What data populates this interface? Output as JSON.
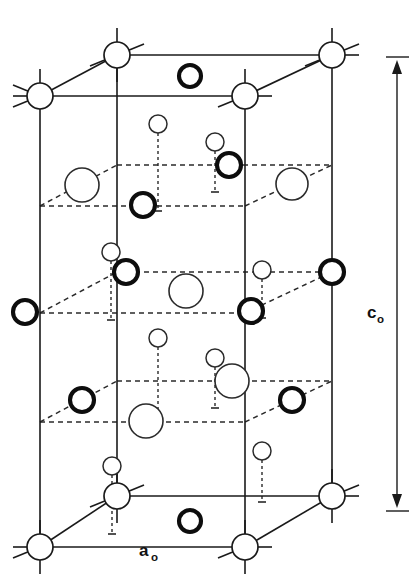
{
  "figure": {
    "kind": "crystal-structure-unit-cell",
    "background_color": "#ffffff",
    "line_color": "#1a1a1a"
  },
  "labels": {
    "c_axis": {
      "base": "c",
      "subscript": "o"
    },
    "a_axis": {
      "base": "a",
      "subscript": "o"
    }
  },
  "dimension_markers": [
    {
      "name": "c-axis-dimension",
      "orientation": "vertical",
      "label": "c₀",
      "arrows": "both-ends",
      "x": 397,
      "y_top": 63,
      "y_bottom": 505
    },
    {
      "name": "a-axis-dimension",
      "orientation": "horizontal",
      "label": "a₀",
      "arrows": "none",
      "y": 552,
      "x_left": 40,
      "x_right": 245
    }
  ],
  "atom_species": [
    {
      "id": "corner",
      "name": "corner-lattice-atom",
      "style": "thin-outline-medium-circle",
      "radius": 13,
      "stroke_width": 1.7,
      "stroke": "#1a1a1a",
      "fill": "#ffffff",
      "has_bond_stubs": true
    },
    {
      "id": "large",
      "name": "large-thin-outline-atom",
      "style": "thin-outline-large-circle",
      "radius": 16,
      "stroke_width": 1.6,
      "stroke": "#2b2b2b",
      "fill": "#ffffff",
      "has_bond_stubs": false
    },
    {
      "id": "bold",
      "name": "bold-outline-atom",
      "style": "thick-outline-circle",
      "radius": 12,
      "stroke_width": 4.1,
      "stroke": "#0d0d0d",
      "fill": "#ffffff",
      "has_bond_stubs": false
    },
    {
      "id": "small",
      "name": "small-thin-outline-atom",
      "style": "thin-outline-small-circle",
      "radius": 9,
      "stroke_width": 1.5,
      "stroke": "#2b2b2b",
      "fill": "#ffffff",
      "has_bond_stubs": false
    }
  ],
  "cell_geometry": {
    "front_left_x": 40,
    "front_right_x": 245,
    "back_left_x": 117,
    "back_right_x": 332,
    "top_front_y": 96,
    "top_back_y": 55,
    "bottom_front_y": 547,
    "bottom_back_y": 496,
    "planes": [
      {
        "name": "plane-top",
        "front_y": 96,
        "back_y": 55,
        "style": "solid"
      },
      {
        "name": "plane-upper-middle",
        "front_y": 206,
        "back_y": 165,
        "style": "dashed"
      },
      {
        "name": "plane-center",
        "front_y": 313,
        "back_y": 272,
        "style": "dashed"
      },
      {
        "name": "plane-lower-middle",
        "front_y": 422,
        "back_y": 381,
        "style": "dashed"
      },
      {
        "name": "plane-bottom",
        "front_y": 547,
        "back_y": 496,
        "style": "solid"
      }
    ]
  },
  "atoms": [
    {
      "name": "atom-corner-top-back-left",
      "species": "corner",
      "cx": 117,
      "cy": 55,
      "plane": "plane-top"
    },
    {
      "name": "atom-corner-top-back-right",
      "species": "corner",
      "cx": 332,
      "cy": 55,
      "plane": "plane-top"
    },
    {
      "name": "atom-corner-top-front-left",
      "species": "corner",
      "cx": 40,
      "cy": 96,
      "plane": "plane-top"
    },
    {
      "name": "atom-corner-top-front-right",
      "species": "corner",
      "cx": 245,
      "cy": 96,
      "plane": "plane-top"
    },
    {
      "name": "atom-bold-top-face",
      "species": "bold",
      "cx": 190,
      "cy": 76,
      "plane": "plane-top"
    },
    {
      "name": "atom-small-upper-a",
      "species": "small",
      "cx": 158,
      "cy": 124,
      "plane": "between-top-and-upper-middle"
    },
    {
      "name": "atom-small-upper-b",
      "species": "small",
      "cx": 215,
      "cy": 142,
      "plane": "between-top-and-upper-middle"
    },
    {
      "name": "atom-large-upper-middle-left",
      "species": "large",
      "cx": 82,
      "cy": 185,
      "plane": "plane-upper-middle"
    },
    {
      "name": "atom-bold-upper-middle-center",
      "species": "bold",
      "cx": 229,
      "cy": 165,
      "plane": "plane-upper-middle"
    },
    {
      "name": "atom-large-upper-middle-right",
      "species": "large",
      "cx": 292,
      "cy": 184,
      "plane": "plane-upper-middle"
    },
    {
      "name": "atom-bold-upper-middle-front",
      "species": "bold",
      "cx": 143,
      "cy": 205,
      "plane": "plane-upper-middle"
    },
    {
      "name": "atom-small-center-a",
      "species": "small",
      "cx": 111,
      "cy": 252,
      "plane": "between-upper-middle-and-center"
    },
    {
      "name": "atom-small-center-b",
      "species": "small",
      "cx": 262,
      "cy": 270,
      "plane": "between-upper-middle-and-center"
    },
    {
      "name": "atom-bold-center-left",
      "species": "bold",
      "cx": 25,
      "cy": 312,
      "plane": "plane-center"
    },
    {
      "name": "atom-bold-center-inner",
      "species": "bold",
      "cx": 126,
      "cy": 272,
      "plane": "plane-center"
    },
    {
      "name": "atom-large-center-middle",
      "species": "large",
      "cx": 186,
      "cy": 291,
      "plane": "plane-center"
    },
    {
      "name": "atom-bold-center-mid-right",
      "species": "bold",
      "cx": 251,
      "cy": 311,
      "plane": "plane-center"
    },
    {
      "name": "atom-bold-center-right",
      "species": "bold",
      "cx": 332,
      "cy": 272,
      "plane": "plane-center"
    },
    {
      "name": "atom-small-lower-a",
      "species": "small",
      "cx": 158,
      "cy": 338,
      "plane": "between-center-and-lower-middle"
    },
    {
      "name": "atom-small-lower-b",
      "species": "small",
      "cx": 215,
      "cy": 358,
      "plane": "between-center-and-lower-middle"
    },
    {
      "name": "atom-bold-lower-middle-left",
      "species": "bold",
      "cx": 82,
      "cy": 400,
      "plane": "plane-lower-middle"
    },
    {
      "name": "atom-large-lower-middle-back",
      "species": "large",
      "cx": 232,
      "cy": 381,
      "plane": "plane-lower-middle"
    },
    {
      "name": "atom-bold-lower-middle-right",
      "species": "bold",
      "cx": 292,
      "cy": 400,
      "plane": "plane-lower-middle"
    },
    {
      "name": "atom-large-lower-middle-front",
      "species": "large",
      "cx": 146,
      "cy": 421,
      "plane": "plane-lower-middle"
    },
    {
      "name": "atom-small-bottom-a",
      "species": "small",
      "cx": 112,
      "cy": 466,
      "plane": "between-lower-middle-and-bottom"
    },
    {
      "name": "atom-small-bottom-b",
      "species": "small",
      "cx": 262,
      "cy": 451,
      "plane": "between-lower-middle-and-bottom"
    },
    {
      "name": "atom-corner-bottom-back-left",
      "species": "corner",
      "cx": 117,
      "cy": 496,
      "plane": "plane-bottom"
    },
    {
      "name": "atom-corner-bottom-back-right",
      "species": "corner",
      "cx": 332,
      "cy": 496,
      "plane": "plane-bottom"
    },
    {
      "name": "atom-corner-bottom-front-left",
      "species": "corner",
      "cx": 40,
      "cy": 547,
      "plane": "plane-bottom"
    },
    {
      "name": "atom-corner-bottom-front-right",
      "species": "corner",
      "cx": 245,
      "cy": 547,
      "plane": "plane-bottom"
    },
    {
      "name": "atom-bold-bottom-face",
      "species": "bold",
      "cx": 190,
      "cy": 521,
      "plane": "plane-bottom"
    }
  ],
  "stems": [
    {
      "name": "stem-small-upper-a",
      "x": 158,
      "y_top": 133,
      "y_bottom": 211
    },
    {
      "name": "stem-small-upper-b",
      "x": 215,
      "y_top": 151,
      "y_bottom": 192
    },
    {
      "name": "stem-small-center-a",
      "x": 111,
      "y_top": 261,
      "y_bottom": 320
    },
    {
      "name": "stem-small-center-b",
      "x": 262,
      "y_top": 279,
      "y_bottom": 318
    },
    {
      "name": "stem-small-lower-a",
      "x": 158,
      "y_top": 347,
      "y_bottom": 427
    },
    {
      "name": "stem-small-lower-b",
      "x": 215,
      "y_top": 367,
      "y_bottom": 408
    },
    {
      "name": "stem-small-bottom-a",
      "x": 112,
      "y_top": 475,
      "y_bottom": 534
    },
    {
      "name": "stem-small-bottom-b",
      "x": 262,
      "y_top": 460,
      "y_bottom": 502
    }
  ]
}
